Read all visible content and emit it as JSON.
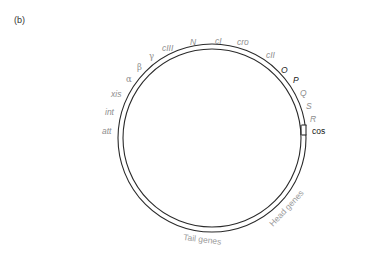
{
  "figure": {
    "panel_label": "(b)"
  },
  "genome_circle": {
    "cx": 212,
    "cy": 138,
    "outer_radius": 94,
    "inner_radius": 89,
    "stroke_color": "#2a2a2a"
  },
  "genes": {
    "cIII": "cIII",
    "N": "N",
    "cI": "cI",
    "cro": "cro",
    "cII": "cII",
    "O": "O",
    "P": "P",
    "Q": "Q",
    "S": "S",
    "R": "R",
    "gamma": "γ",
    "beta": "β",
    "alpha": "α",
    "xis": "xis",
    "int": "int",
    "att": "att"
  },
  "sites": {
    "cos": "cos"
  },
  "regions": {
    "tail": "Tail genes",
    "head": "Head genes"
  },
  "colors": {
    "gray_label": "#8e8e8e",
    "dark_label": "#1a1a1a",
    "circle": "#2a2a2a"
  }
}
